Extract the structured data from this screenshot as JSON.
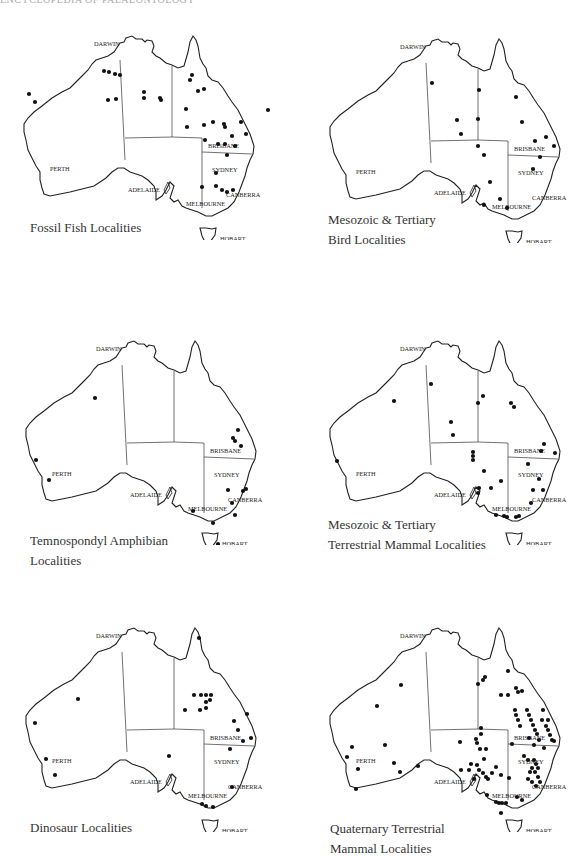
{
  "running_header": "ENCYCLOPEDIA OF PALAEONTOLOGY",
  "cities": {
    "darwin": "DARWIN",
    "perth": "PERTH",
    "adelaide": "ADELAIDE",
    "melbourne": "MELBOURNE",
    "brisbane": "BRISBANE",
    "sydney": "SYDNEY",
    "canberra": "CANBERRA",
    "hobart": "HOBART"
  },
  "maps": [
    {
      "id": "fossil-fish",
      "caption_lines": [
        "Fossil Fish Localities",
        ""
      ],
      "dots": [
        [
          84,
          41
        ],
        [
          89,
          42
        ],
        [
          95,
          44
        ],
        [
          100,
          45
        ],
        [
          9,
          64
        ],
        [
          15,
          72
        ],
        [
          88,
          70
        ],
        [
          96,
          69
        ],
        [
          124,
          62
        ],
        [
          124,
          68
        ],
        [
          140,
          68
        ],
        [
          141,
          70
        ],
        [
          172,
          45
        ],
        [
          170,
          50
        ],
        [
          178,
          61
        ],
        [
          184,
          59
        ],
        [
          166,
          79
        ],
        [
          167,
          97
        ],
        [
          184,
          95
        ],
        [
          193,
          92
        ],
        [
          204,
          94
        ],
        [
          205,
          97
        ],
        [
          221,
          92
        ],
        [
          185,
          110
        ],
        [
          198,
          114
        ],
        [
          205,
          114
        ],
        [
          212,
          106
        ],
        [
          215,
          116
        ],
        [
          207,
          125
        ],
        [
          196,
          143
        ],
        [
          226,
          104
        ],
        [
          248,
          80
        ],
        [
          182,
          157
        ],
        [
          196,
          156
        ],
        [
          202,
          160
        ],
        [
          207,
          162
        ],
        [
          213,
          160
        ]
      ]
    },
    {
      "id": "bird",
      "caption_lines": [
        "Mesozoic & Tertiary",
        "Bird Localities"
      ],
      "dots": [
        [
          106,
          50
        ],
        [
          131,
          87
        ],
        [
          153,
          57
        ],
        [
          152,
          86
        ],
        [
          135,
          101
        ],
        [
          152,
          113
        ],
        [
          158,
          122
        ],
        [
          190,
          64
        ],
        [
          196,
          89
        ],
        [
          209,
          108
        ],
        [
          207,
          136
        ],
        [
          220,
          104
        ],
        [
          214,
          124
        ],
        [
          228,
          113
        ],
        [
          164,
          149
        ],
        [
          181,
          175
        ],
        [
          158,
          172
        ],
        [
          174,
          166
        ]
      ]
    },
    {
      "id": "temnospondyl",
      "caption_lines": [
        "Temnospondyl Amphibian",
        "Localities"
      ],
      "dots": [
        [
          73,
          63
        ],
        [
          216,
          95
        ],
        [
          211,
          103
        ],
        [
          213,
          106
        ],
        [
          219,
          111
        ],
        [
          206,
          155
        ],
        [
          221,
          156
        ],
        [
          224,
          154
        ],
        [
          210,
          168
        ],
        [
          171,
          176
        ],
        [
          191,
          188
        ],
        [
          213,
          180
        ],
        [
          14,
          125
        ],
        [
          27,
          145
        ],
        [
          196,
          209
        ]
      ]
    },
    {
      "id": "terrestrial-mammal",
      "caption_lines": [
        "Mesozoic & Tertiary",
        "Terrestrial Mammal Localities"
      ],
      "dots": [
        [
          68,
          66
        ],
        [
          105,
          49
        ],
        [
          125,
          87
        ],
        [
          127,
          100
        ],
        [
          157,
          61
        ],
        [
          152,
          68
        ],
        [
          185,
          68
        ],
        [
          188,
          72
        ],
        [
          147,
          117
        ],
        [
          147,
          121
        ],
        [
          147,
          125
        ],
        [
          158,
          136
        ],
        [
          218,
          109
        ],
        [
          215,
          116
        ],
        [
          229,
          118
        ],
        [
          202,
          129
        ],
        [
          175,
          146
        ],
        [
          165,
          153
        ],
        [
          213,
          144
        ],
        [
          207,
          155
        ],
        [
          217,
          155
        ],
        [
          205,
          168
        ],
        [
          170,
          180
        ],
        [
          178,
          181
        ],
        [
          181,
          182
        ],
        [
          190,
          182
        ],
        [
          193,
          181
        ],
        [
          11,
          126
        ],
        [
          153,
          153
        ],
        [
          152,
          158
        ]
      ]
    },
    {
      "id": "dinosaur",
      "caption_lines": [
        "Dinosaur Localities",
        ""
      ],
      "dots": [
        [
          177,
          16
        ],
        [
          172,
          73
        ],
        [
          179,
          73
        ],
        [
          184,
          73
        ],
        [
          189,
          73
        ],
        [
          188,
          78
        ],
        [
          184,
          80
        ],
        [
          184,
          86
        ],
        [
          178,
          88
        ],
        [
          163,
          88
        ],
        [
          225,
          92
        ],
        [
          212,
          99
        ],
        [
          216,
          108
        ],
        [
          221,
          119
        ],
        [
          229,
          116
        ],
        [
          208,
          127
        ],
        [
          147,
          134
        ],
        [
          24,
          137
        ],
        [
          33,
          153
        ],
        [
          56,
          77
        ],
        [
          13,
          101
        ],
        [
          180,
          182
        ],
        [
          184,
          184
        ],
        [
          191,
          185
        ],
        [
          210,
          165
        ]
      ]
    },
    {
      "id": "quaternary-mammal",
      "caption_lines": [
        "Quaternary Terrestrial",
        "Mammal Localities"
      ],
      "dots": [
        [
          75,
          63
        ],
        [
          51,
          84
        ],
        [
          182,
          49
        ],
        [
          152,
          62
        ],
        [
          157,
          58
        ],
        [
          159,
          55
        ],
        [
          175,
          73
        ],
        [
          182,
          73
        ],
        [
          190,
          66
        ],
        [
          192,
          70
        ],
        [
          196,
          69
        ],
        [
          189,
          88
        ],
        [
          190,
          93
        ],
        [
          192,
          98
        ],
        [
          194,
          104
        ],
        [
          201,
          88
        ],
        [
          203,
          93
        ],
        [
          205,
          98
        ],
        [
          207,
          103
        ],
        [
          209,
          108
        ],
        [
          211,
          112
        ],
        [
          213,
          118
        ],
        [
          216,
          98
        ],
        [
          220,
          104
        ],
        [
          222,
          108
        ],
        [
          224,
          113
        ],
        [
          226,
          118
        ],
        [
          228,
          119
        ],
        [
          217,
          88
        ],
        [
          222,
          98
        ],
        [
          203,
          116
        ],
        [
          208,
          123
        ],
        [
          218,
          126
        ],
        [
          186,
          122
        ],
        [
          198,
          134
        ],
        [
          202,
          138
        ],
        [
          208,
          138
        ],
        [
          210,
          142
        ],
        [
          212,
          146
        ],
        [
          206,
          146
        ],
        [
          204,
          150
        ],
        [
          209,
          150
        ],
        [
          212,
          155
        ],
        [
          214,
          160
        ],
        [
          202,
          157
        ],
        [
          206,
          160
        ],
        [
          210,
          164
        ],
        [
          155,
          106
        ],
        [
          155,
          112
        ],
        [
          150,
          117
        ],
        [
          151,
          121
        ],
        [
          154,
          127
        ],
        [
          160,
          127
        ],
        [
          158,
          137
        ],
        [
          134,
          120
        ],
        [
          145,
          142
        ],
        [
          151,
          143
        ],
        [
          153,
          148
        ],
        [
          157,
          151
        ],
        [
          160,
          155
        ],
        [
          148,
          157
        ],
        [
          162,
          157
        ],
        [
          166,
          151
        ],
        [
          170,
          145
        ],
        [
          175,
          153
        ],
        [
          183,
          156
        ],
        [
          191,
          175
        ],
        [
          161,
          173
        ],
        [
          170,
          180
        ],
        [
          173,
          181
        ],
        [
          176,
          181
        ],
        [
          180,
          181
        ],
        [
          196,
          178
        ],
        [
          175,
          191
        ],
        [
          26,
          125
        ],
        [
          59,
          123
        ],
        [
          21,
          135
        ],
        [
          32,
          147
        ],
        [
          68,
          141
        ],
        [
          74,
          150
        ],
        [
          92,
          144
        ],
        [
          30,
          167
        ],
        [
          135,
          148
        ],
        [
          143,
          148
        ]
      ]
    }
  ]
}
